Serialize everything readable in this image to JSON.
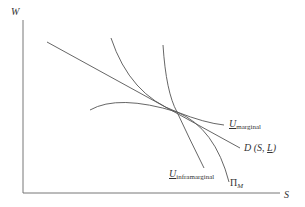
{
  "diagram": {
    "axes": {
      "y_label": "W",
      "x_label": "S"
    },
    "curves": [
      {
        "id": "u-marginal",
        "label_main": "U",
        "label_sub": "marginal",
        "underlined": true,
        "description": "concave indifference curve, tangent at equilibrium"
      },
      {
        "id": "demand",
        "label_main": "D",
        "label_args_pre": "(S, ",
        "label_args_L": "L",
        "label_args_post": ")",
        "description": "straight downward-sloping line"
      },
      {
        "id": "u-inframarginal",
        "label_main": "U",
        "label_sub": "inframarginal",
        "underlined": true,
        "description": "steep convex curve"
      },
      {
        "id": "profit",
        "label_main": "Π",
        "label_sub": "M",
        "description": "isoprofit curve"
      }
    ],
    "colors": {
      "line": "#555555",
      "text": "#333333",
      "background": "#ffffff"
    }
  }
}
